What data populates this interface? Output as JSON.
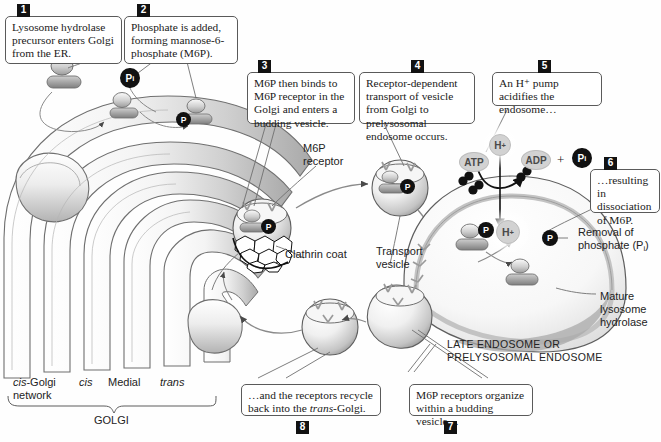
{
  "steps": [
    {
      "number": "1",
      "text": "Lysosome hydrolase precursor enters Golgi from the ER."
    },
    {
      "number": "2",
      "text": "Phosphate is added, forming mannose-6-phosphate (M6P)."
    },
    {
      "number": "3",
      "text": "M6P then binds to M6P receptor in the Golgi and enters a budding vesicle."
    },
    {
      "number": "4",
      "text": "Receptor-dependent transport of vesicle from Golgi to prelysosomal endosome occurs."
    },
    {
      "number": "5",
      "text": "An H⁺ pump acidifies the endosome…"
    },
    {
      "number": "6",
      "text": "…resulting in dissociation of M6P."
    },
    {
      "number": "7",
      "text": "M6P receptors organize within a budding vesicle…"
    },
    {
      "number": "8",
      "text": "…and the receptors recycle back into the trans-Golgi."
    }
  ],
  "labels": {
    "m6p_receptor": "M6P\nreceptor",
    "m6p_receptor_l1": "M6P",
    "m6p_receptor_l2": "receptor",
    "clathrin_coat": "Clathrin coat",
    "transport_vesicle_l1": "Transport",
    "transport_vesicle_l2": "vesicle",
    "removal_l1": "Removal  of",
    "removal_l2": "phosphate (P",
    "removal_l2_sub": "i",
    "removal_l2_end": ")",
    "mature_l1": "Mature",
    "mature_l2": "lysosome",
    "mature_l3": "hydrolase",
    "endosome_l1": "LATE ENDOSOME OR",
    "endosome_l2": "PRELYSOSOMAL ENDOSOME",
    "cis_golgi_network_l1": "cis-Golgi",
    "cis_golgi_network_l1_italic": "cis",
    "cis_golgi_network_l1_rest": "-Golgi",
    "cis_golgi_network_l2": "network",
    "cis": "cis",
    "medial": "Medial",
    "trans": "trans",
    "golgi": "GOLGI"
  },
  "molecules": {
    "atp": "ATP",
    "adp": "ADP",
    "pi_label": "P",
    "pi_sub": "i",
    "p_label": "P",
    "h_label": "H",
    "h_sup": "+",
    "plus_sign": "+"
  },
  "colors": {
    "ink": "#1a1a1a",
    "box_border": "#5a5a5a",
    "badge_bg": "#121212",
    "membrane_light": "#f2f2f2",
    "membrane_mid": "#c9c9c9",
    "membrane_dark": "#8e8e8e",
    "cargo_gray": "#9a9a9a",
    "chip_dark": "#111111",
    "chip_light": "#d2d2d2",
    "outline": "#6b6b6b"
  }
}
